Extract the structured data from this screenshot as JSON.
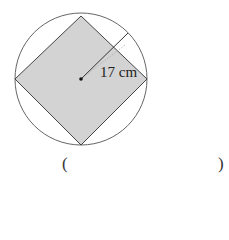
{
  "figure": {
    "label": "17 cm",
    "shape": "square inscribed in circle",
    "colors": {
      "fill": "#d3d3d3",
      "stroke": "#555555"
    }
  },
  "answer": {
    "open": "(",
    "close": ")",
    "value": ""
  }
}
